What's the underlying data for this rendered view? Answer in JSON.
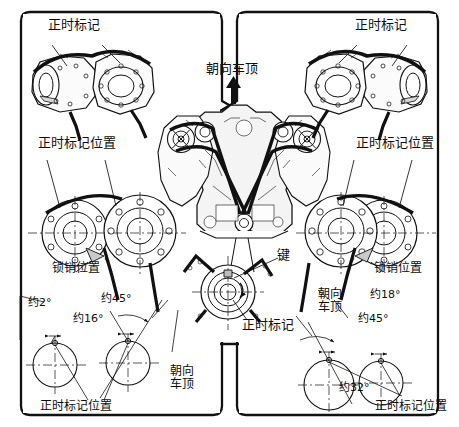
{
  "diagram": {
    "background_color": "#ffffff",
    "line_color": "#111111",
    "panel_border_color": "#111111"
  },
  "panels": {
    "left": {
      "name": "左侧气缸组正时标记",
      "labels": {
        "timing_mark": "正时标记",
        "timing_mark_position_top": "正时标记位置",
        "lock_pin_position": "锁销位置",
        "angle_2": "约2°",
        "angle_45": "约45°",
        "angle_16": "约16°",
        "toward_roof": "朝向\n车顶",
        "timing_mark_position_bottom": "正时标记位置"
      }
    },
    "right": {
      "name": "右侧气缸组正时标记",
      "labels": {
        "timing_mark": "正时标记",
        "timing_mark_position_top": "正时标记位置",
        "lock_pin_position": "锁销位置",
        "toward_roof": "朝向\n车顶",
        "angle_18": "约18°",
        "angle_45": "约45°",
        "angle_32": "约32°",
        "timing_mark_position_bottom": "正时标记位置"
      }
    },
    "bottom_center": {
      "name": "曲轴链轮键位详图",
      "labels": {
        "key": "键",
        "timing_mark": "正时标记"
      }
    },
    "center_engine": {
      "name": "V型发动机正时链条总成视图",
      "labels": {
        "toward_roof": "朝向车顶"
      },
      "arrow": "up-arrow"
    }
  }
}
